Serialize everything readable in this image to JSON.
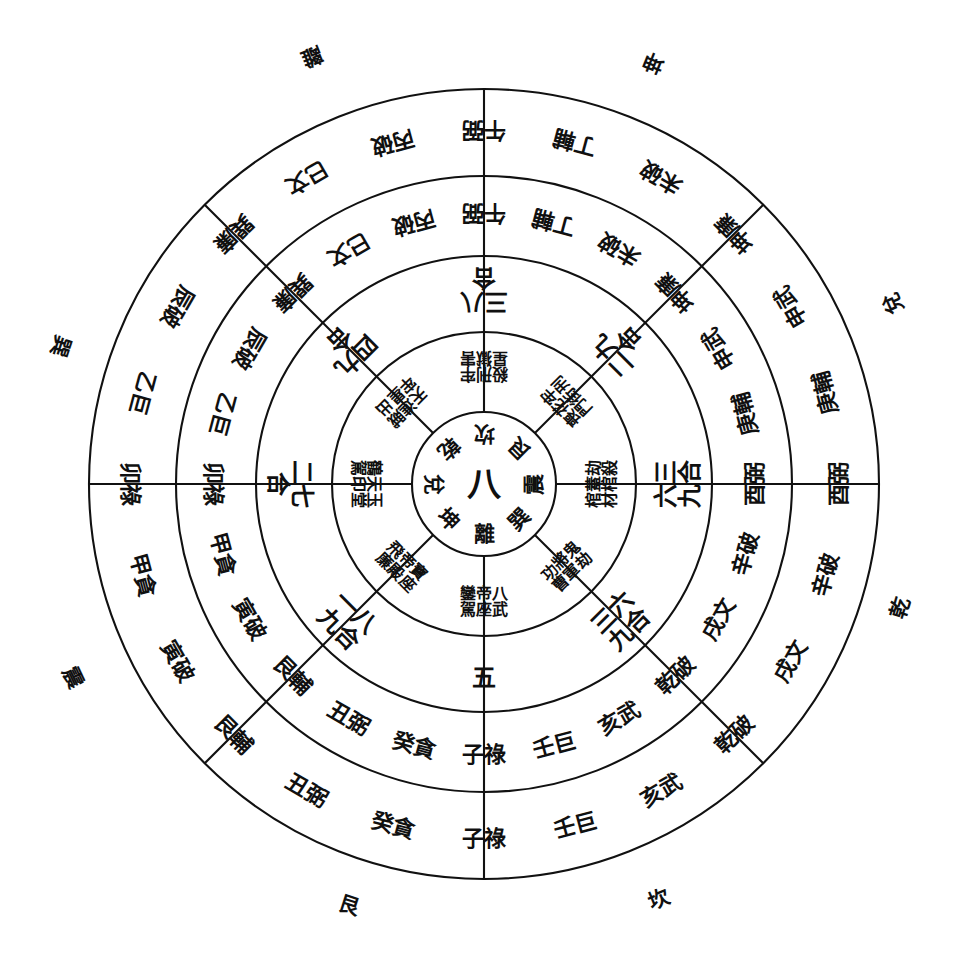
{
  "diagram": {
    "center_number": "八",
    "ink_color": "#101010",
    "paper_color": "#ffffff",
    "rings": 5,
    "sectors": 8
  },
  "center": {
    "number": "八",
    "trigrams": [
      "乾",
      "坎",
      "艮",
      "震",
      "巽",
      "離",
      "坤",
      "兌"
    ],
    "trigram_positions": [
      {
        "name": "巽",
        "angle": -45
      },
      {
        "name": "離",
        "angle": 0
      },
      {
        "name": "坤",
        "angle": 45
      },
      {
        "name": "兌",
        "angle": 90
      },
      {
        "name": "乾",
        "angle": 135
      },
      {
        "name": "坎",
        "angle": 180
      },
      {
        "name": "艮",
        "angle": 225
      },
      {
        "name": "震",
        "angle": 270
      }
    ]
  },
  "ring_inner": {
    "name": "神煞星曜層",
    "sectors": [
      {
        "dir": "N",
        "angle": 0,
        "text": "鑾帝八\n駕座武"
      },
      {
        "dir": "NE",
        "angle": 45,
        "text": "飛帝寶\n廉殿座"
      },
      {
        "dir": "E",
        "angle": 90,
        "text": "鶴天玉\n駕印堂"
      },
      {
        "dir": "SE",
        "angle": 135,
        "text": "天進賊\n牢星出"
      },
      {
        "dir": "S",
        "angle": 180,
        "text": "殺刑牢\n星獄害"
      },
      {
        "dir": "SW",
        "angle": 225,
        "text": "喪花牢\n門街刑"
      },
      {
        "dir": "W",
        "angle": 270,
        "text": "棺蓋劫\n材棺殺"
      },
      {
        "dir": "NW",
        "angle": 315,
        "text": "功將鬼\n曹軍劫"
      }
    ]
  },
  "ring_numbers": {
    "name": "合數層",
    "sectors": [
      {
        "dir": "N",
        "angle": 0,
        "text": "五"
      },
      {
        "dir": "NE",
        "angle": 45,
        "text": "一八\n九合"
      },
      {
        "dir": "E",
        "angle": 90,
        "text": "二七\n合"
      },
      {
        "dir": "SE",
        "angle": 135,
        "text": "四九\n合"
      },
      {
        "dir": "S",
        "angle": 180,
        "text": "三八\n合"
      },
      {
        "dir": "SW",
        "angle": 225,
        "text": "二九\n合"
      },
      {
        "dir": "W",
        "angle": 270,
        "text": "六三\n九合"
      },
      {
        "dir": "NW",
        "angle": 315,
        "text": "三六\n九合"
      }
    ]
  },
  "ring_mountains_inner": {
    "name": "二十四山九星層 (內)",
    "sectors": [
      {
        "dir": "N",
        "angle": 0,
        "cells": [
          "壬巨",
          "子祿",
          "癸貪"
        ]
      },
      {
        "dir": "NE",
        "angle": 45,
        "cells": [
          "丑弼",
          "艮輔",
          "寅破"
        ]
      },
      {
        "dir": "E",
        "angle": 90,
        "cells": [
          "甲貪",
          "卯祿",
          "乙巨"
        ]
      },
      {
        "dir": "SE",
        "angle": 135,
        "cells": [
          "辰破",
          "巽廉",
          "巳文"
        ]
      },
      {
        "dir": "S",
        "angle": 180,
        "cells": [
          "丙破",
          "午弼",
          "丁輔"
        ]
      },
      {
        "dir": "SW",
        "angle": 225,
        "cells": [
          "未破",
          "坤廉",
          "申武"
        ]
      },
      {
        "dir": "W",
        "angle": 270,
        "cells": [
          "庚輔",
          "酉弼",
          "辛破"
        ]
      },
      {
        "dir": "NW",
        "angle": 315,
        "cells": [
          "戌文",
          "乾破",
          "亥武"
        ]
      }
    ]
  },
  "ring_mountains_outer": {
    "name": "二十四山九星層 (外)",
    "sectors": [
      {
        "dir": "N",
        "angle": 0,
        "cells": [
          "壬巨",
          "子祿",
          "癸貪"
        ]
      },
      {
        "dir": "NE",
        "angle": 45,
        "cells": [
          "丑弼",
          "艮輔",
          "寅破"
        ]
      },
      {
        "dir": "E",
        "angle": 90,
        "cells": [
          "甲貪",
          "卯祿",
          "乙巨"
        ]
      },
      {
        "dir": "SE",
        "angle": 135,
        "cells": [
          "辰破",
          "巽廉",
          "巳文"
        ]
      },
      {
        "dir": "S",
        "angle": 180,
        "cells": [
          "丙破",
          "午弼",
          "丁輔"
        ]
      },
      {
        "dir": "SW",
        "angle": 225,
        "cells": [
          "未破",
          "坤廉",
          "申武"
        ]
      },
      {
        "dir": "W",
        "angle": 270,
        "cells": [
          "庚輔",
          "酉弼",
          "辛破"
        ]
      },
      {
        "dir": "NW",
        "angle": 315,
        "cells": [
          "戌文",
          "乾破",
          "亥武"
        ]
      }
    ]
  },
  "outer_labels": [
    {
      "name": "離",
      "x": 312,
      "y": 57
    },
    {
      "name": "坤",
      "x": 654,
      "y": 63
    },
    {
      "name": "兌",
      "x": 893,
      "y": 303
    },
    {
      "name": "乾",
      "x": 900,
      "y": 608
    },
    {
      "name": "坎",
      "x": 659,
      "y": 899
    },
    {
      "name": "艮",
      "x": 349,
      "y": 905
    },
    {
      "name": "震",
      "x": 73,
      "y": 677
    },
    {
      "name": "巽",
      "x": 61,
      "y": 346
    }
  ],
  "geometry": {
    "cx": 484,
    "cy": 484,
    "r_center": 72,
    "r1": 152,
    "r2": 228,
    "r3": 308,
    "r4": 395,
    "rotation_offset_deg": 0
  }
}
